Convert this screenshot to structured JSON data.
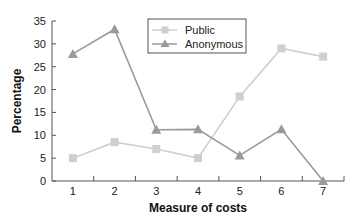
{
  "chart_data": {
    "type": "line",
    "title": "",
    "xlabel": "Measure of costs",
    "ylabel": "Percentage",
    "categories": [
      "1",
      "2",
      "3",
      "4",
      "5",
      "6",
      "7"
    ],
    "ylim": [
      0,
      35
    ],
    "yticks": [
      0,
      5,
      10,
      15,
      20,
      25,
      30,
      35
    ],
    "grid": false,
    "legend_position": "upper center",
    "series": [
      {
        "name": "Public",
        "marker": "square",
        "color": "#cfcfcf",
        "values": [
          5,
          8.5,
          7,
          5,
          18.5,
          29,
          27.2
        ]
      },
      {
        "name": "Anonymous",
        "marker": "triangle",
        "color": "#9a9a9a",
        "values": [
          27.8,
          33.2,
          11.2,
          11.3,
          5.6,
          11.3,
          0
        ]
      }
    ]
  },
  "legend": {
    "items": [
      {
        "label": "Public"
      },
      {
        "label": "Anonymous"
      }
    ]
  },
  "axes": {
    "x_title": "Measure of costs",
    "y_title": "Percentage"
  }
}
